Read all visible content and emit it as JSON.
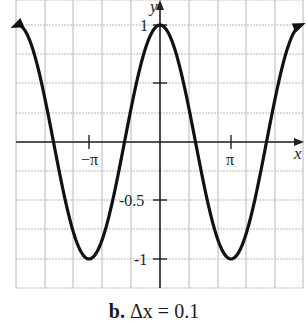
{
  "chart_data": {
    "type": "line",
    "title": "",
    "function": "y = cos x",
    "series": [
      {
        "name": "y = cos x",
        "x_step": 0.1,
        "x_range": [
          -6.37,
          6.2
        ]
      }
    ],
    "xlabel": "x",
    "ylabel": "y",
    "xlim": [
      -6.37,
      6.33
    ],
    "ylim": [
      -1.25,
      1.25
    ],
    "x_ticks": [
      {
        "value": -3.14159,
        "label": "−π"
      },
      {
        "value": 3.14159,
        "label": "π"
      }
    ],
    "y_ticks": [
      {
        "value": 1,
        "label": "1"
      },
      {
        "value": 0.5,
        "label": ""
      },
      {
        "value": -0.5,
        "label": "-0.5"
      },
      {
        "value": -1,
        "label": "-1"
      }
    ],
    "grid": true,
    "grid_color": "#b8b8b8",
    "curve_color": "#111111",
    "key_points": [
      {
        "x": 0,
        "y": 1
      },
      {
        "x": -3.14159,
        "y": -1
      },
      {
        "x": 3.14159,
        "y": -1
      },
      {
        "x": -1.5708,
        "y": 0
      },
      {
        "x": 1.5708,
        "y": 0
      },
      {
        "x": -4.7124,
        "y": 0
      },
      {
        "x": 4.7124,
        "y": 0
      }
    ]
  },
  "caption": {
    "label": "b.",
    "text": "Δx = 0.1"
  },
  "axis_labels": {
    "x": "x",
    "y": "y"
  },
  "tick_labels": {
    "neg_pi": "−π",
    "pi": "π",
    "one": "1",
    "neg_half": "-0.5",
    "neg_one": "-1"
  }
}
